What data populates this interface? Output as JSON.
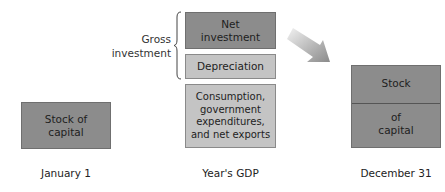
{
  "diagram": {
    "left": {
      "box_label": "Stock of capital",
      "box_line1": "Stock of",
      "box_line2": "capital",
      "caption": "January 1"
    },
    "middle": {
      "gross_investment_line1": "Gross",
      "gross_investment_line2": "investment",
      "net_investment_line1": "Net",
      "net_investment_line2": "investment",
      "depreciation": "Depreciation",
      "consumption_line1": "Consumption,",
      "consumption_line2": "government",
      "consumption_line3": "expenditures,",
      "consumption_line4": "and net exports",
      "caption": "Year's GDP"
    },
    "right": {
      "top_label": "Stock",
      "bottom_line1": "of",
      "bottom_line2": "capital",
      "caption": "December 31"
    },
    "colors": {
      "dark_box": "#8c8c8c",
      "light_box": "#c4c4c4",
      "arrow_start": "#f0f0f0",
      "arrow_end": "#8a8a8a"
    }
  }
}
